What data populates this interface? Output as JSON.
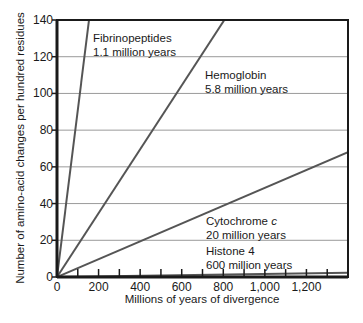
{
  "chart_data": {
    "type": "line",
    "title": "",
    "xlabel": "Millions of years of divergence",
    "ylabel": "Number of amino-acid changes per hundred residues",
    "xlim": [
      0,
      1400
    ],
    "ylim": [
      0,
      140
    ],
    "x_ticks": [
      0,
      200,
      400,
      600,
      800,
      1000,
      1200
    ],
    "x_tick_labels": [
      "0",
      "200",
      "400",
      "600",
      "800",
      "1,000",
      "1,200"
    ],
    "x_minor_tick_step": 100,
    "y_ticks": [
      0,
      20,
      40,
      60,
      80,
      100,
      120,
      140
    ],
    "y_tick_labels": [
      "0",
      "20",
      "40",
      "60",
      "80",
      "100",
      "120",
      "140"
    ],
    "grid": {
      "horizontal": true,
      "vertical": false
    },
    "legend": "none (inline annotations)",
    "series": [
      {
        "name": "Fibrinopeptides",
        "annotation": "1.1 million years",
        "x": [
          0,
          154
        ],
        "y": [
          0,
          140
        ]
      },
      {
        "name": "Hemoglobin",
        "annotation": "5.8 million years",
        "x": [
          0,
          805
        ],
        "y": [
          0,
          140
        ]
      },
      {
        "name": "Cytochrome c",
        "annotation": "20 million years",
        "x": [
          0,
          1400
        ],
        "y": [
          0,
          68
        ]
      },
      {
        "name": "Histone 4",
        "annotation": "600 million years",
        "x": [
          0,
          1400
        ],
        "y": [
          0,
          2.3
        ]
      }
    ]
  },
  "annotations": [
    {
      "line1": "Fibrinopeptides",
      "line2": "1.1 million years"
    },
    {
      "line1": "Hemoglobin",
      "line2": "5.8 million years"
    },
    {
      "line1": "Cytochrome ",
      "line1_italic": "c",
      "line2": "20 million years"
    },
    {
      "line1": "Histone 4",
      "line2": "600 million years"
    }
  ],
  "colors": {
    "frame": "#1a1a1a",
    "grid": "#9a9a9a",
    "series_line": "#555555"
  }
}
